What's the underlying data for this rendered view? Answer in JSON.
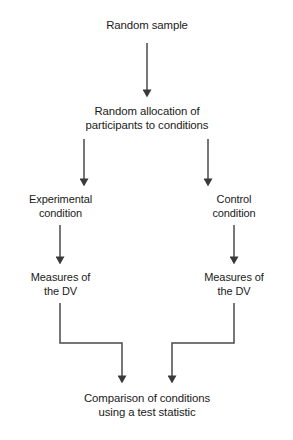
{
  "diagram": {
    "type": "flowchart",
    "colors": {
      "background": "#ffffff",
      "box_border": "#2b2b2b",
      "box_fill": "#ffffff",
      "connector": "#4a4a4a",
      "text": "#1a1a1a"
    },
    "nodes": [
      {
        "id": "random-sample",
        "label": "Random sample",
        "x": 63,
        "y": 9,
        "w": 168,
        "h": 34
      },
      {
        "id": "random-allocation",
        "label": "Random allocation of\nparticipants to conditions",
        "x": 63,
        "y": 99,
        "w": 168,
        "h": 40
      },
      {
        "id": "experimental-condition",
        "label": "Experimental\ncondition",
        "x": 16,
        "y": 188,
        "w": 89,
        "h": 37
      },
      {
        "id": "control-condition",
        "label": "Control\ncondition",
        "x": 190,
        "y": 188,
        "w": 88,
        "h": 37
      },
      {
        "id": "measures-dv-experimental",
        "label": "Measures of\nthe DV",
        "x": 16,
        "y": 266,
        "w": 89,
        "h": 37
      },
      {
        "id": "measures-dv-control",
        "label": "Measures of\nthe DV",
        "x": 190,
        "y": 266,
        "w": 88,
        "h": 37
      },
      {
        "id": "comparison-of-conditions",
        "label": "Comparison of conditions\nusing a test statistic",
        "x": 63,
        "y": 385,
        "w": 168,
        "h": 42
      }
    ],
    "edges": [
      {
        "id": "sample-to-allocation",
        "from": "random-sample",
        "to": "random-allocation",
        "style": "straight"
      },
      {
        "id": "allocation-to-experimental",
        "from": "random-allocation",
        "to": "experimental-condition",
        "style": "straight"
      },
      {
        "id": "allocation-to-control",
        "from": "random-allocation",
        "to": "control-condition",
        "style": "straight"
      },
      {
        "id": "experimental-to-measures",
        "from": "experimental-condition",
        "to": "measures-dv-experimental",
        "style": "straight"
      },
      {
        "id": "control-to-measures",
        "from": "control-condition",
        "to": "measures-dv-control",
        "style": "straight"
      },
      {
        "id": "measures-left-to-comparison",
        "from": "measures-dv-experimental",
        "to": "comparison-of-conditions",
        "style": "elbow"
      },
      {
        "id": "measures-right-to-comparison",
        "from": "measures-dv-control",
        "to": "comparison-of-conditions",
        "style": "elbow"
      }
    ]
  }
}
